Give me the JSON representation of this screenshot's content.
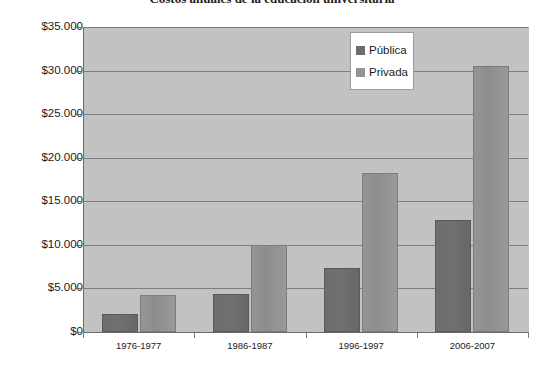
{
  "chart_data": {
    "type": "bar",
    "title": "Costos anuales de la educación universitaria",
    "xlabel": "",
    "ylabel": "",
    "categories": [
      "1976-1977",
      "1986-1987",
      "1996-1997",
      "2006-2007"
    ],
    "series": [
      {
        "name": "Pública",
        "color": "#6d6d6d",
        "values": [
          2100,
          4400,
          7400,
          12800
        ]
      },
      {
        "name": "Privada",
        "color": "#939393",
        "values": [
          4300,
          10000,
          18300,
          30500
        ]
      }
    ],
    "ylim": [
      0,
      35000
    ],
    "ytick_values": [
      35000,
      30000,
      25000,
      20000,
      15000,
      10000,
      5000,
      0
    ],
    "ytick_labels": [
      "$35.000",
      "$30.000",
      "$25.000",
      "$20.000",
      "$15.000",
      "$10.000",
      "$5.000",
      "$0"
    ],
    "grid": true,
    "legend_position": "top-right",
    "plot_background": "#c2c2c2",
    "figure_background": "#ffffff"
  },
  "legend": {
    "entries": [
      {
        "label": "Pública",
        "swatch": "publica"
      },
      {
        "label": "Privada",
        "swatch": "privada"
      }
    ]
  }
}
